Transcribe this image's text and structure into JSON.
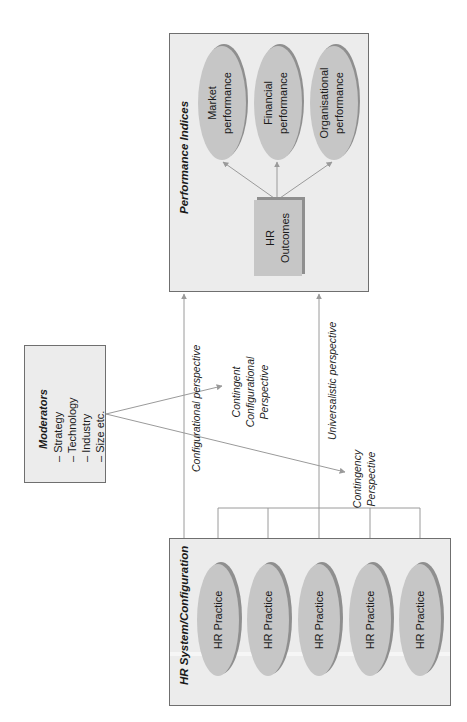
{
  "colors": {
    "panel_fill": "#ececec",
    "panel_border": "#6f6f6f",
    "node_fill": "#c6c6c6",
    "node_shadow": "#8f8f8f",
    "connector": "#9a9a9a",
    "text": "#1a1a1a"
  },
  "orientation": "rotated 90° counter-clockwise",
  "performance_indices": {
    "title": "Performance Indices",
    "hr_outcomes": {
      "line1": "HR",
      "line2": "Outcomes"
    },
    "indices": [
      {
        "line1": "Market",
        "line2": "performance"
      },
      {
        "line1": "Financial",
        "line2": "performance"
      },
      {
        "line1": "Organisational",
        "line2": "performance"
      }
    ]
  },
  "moderators": {
    "title": "Moderators",
    "items": [
      "– Strategy",
      "– Technology",
      "– Industry",
      "– Size etc."
    ]
  },
  "perspectives": {
    "configurational": "Configurational perspective",
    "contingent_configurational": [
      "Contingent",
      "Configurational",
      "Perspective"
    ],
    "universalistic": "Universalistic perspective",
    "contingency": [
      "Contingency",
      "Perspective"
    ]
  },
  "hr_system": {
    "title": "HR System/Configuration",
    "practices": [
      "HR Practice",
      "HR Practice",
      "HR Practice",
      "HR Practice",
      "HR Practice"
    ]
  }
}
